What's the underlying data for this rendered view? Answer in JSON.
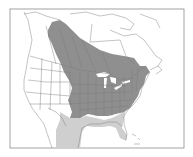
{
  "map": {
    "type": "species-range-map",
    "region": "North America",
    "colors": {
      "background": "#ffffff",
      "land": "#ffffff",
      "border_lines": "#7a7a7a",
      "frame": "#8c8c8c",
      "range_primary": "#8f8f8f",
      "range_secondary": "#cfcfcf",
      "lakes": "#ffffff"
    },
    "legend": []
  }
}
